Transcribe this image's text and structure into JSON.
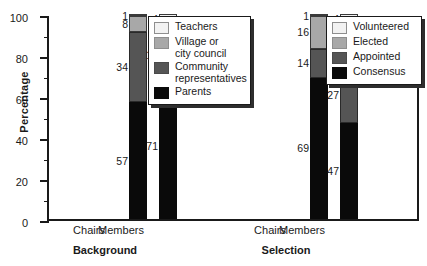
{
  "chart_data": {
    "type": "bar",
    "title": "",
    "subtitle": "",
    "xlabel": "",
    "ylabel": "Percentage",
    "ylim": [
      0,
      100
    ],
    "yticks": [
      0,
      20,
      40,
      60,
      80,
      100
    ],
    "ytick_labels": [
      "0",
      "20",
      "40",
      "60",
      "80",
      "100"
    ],
    "minor_ticks": [
      10,
      30,
      50,
      70,
      90
    ],
    "grid": false,
    "stacked": true,
    "orientation": "vertical",
    "legend_position": "inside-top-right of each panel",
    "panels": [
      {
        "name": "Background",
        "label": "Background",
        "categories": [
          "Chairs",
          "Members"
        ],
        "series": [
          {
            "name": "Parents",
            "color": "#0a0a0a",
            "values": [
              57,
              71
            ]
          },
          {
            "name": "Community representatives",
            "color": "#555555",
            "values": [
              34,
              18
            ]
          },
          {
            "name": "Village or city council",
            "color": "#a8a8a8",
            "values": [
              8,
              7
            ]
          },
          {
            "name": "Teachers",
            "color": "#f2f2f2",
            "values": [
              1,
              4
            ]
          }
        ],
        "legend": [
          {
            "label": "Teachers",
            "color": "#f2f2f2",
            "swatch": "c-white"
          },
          {
            "label": "Village or\ncity council",
            "color": "#a8a8a8",
            "swatch": "c-light"
          },
          {
            "label": "Community\nrepresentatives",
            "color": "#555555",
            "swatch": "c-dark"
          },
          {
            "label": "Parents",
            "color": "#0a0a0a",
            "swatch": "c-black"
          }
        ]
      },
      {
        "name": "Selection",
        "label": "Selection",
        "categories": [
          "Chairs",
          "Members"
        ],
        "series": [
          {
            "name": "Consensus",
            "color": "#0a0a0a",
            "values": [
              69,
              47
            ]
          },
          {
            "name": "Appointed",
            "color": "#555555",
            "values": [
              14,
              27
            ]
          },
          {
            "name": "Elected",
            "color": "#a8a8a8",
            "values": [
              16,
              22
            ]
          },
          {
            "name": "Volunteered",
            "color": "#f2f2f2",
            "values": [
              1,
              4
            ]
          }
        ],
        "legend": [
          {
            "label": "Volunteered",
            "color": "#f2f2f2",
            "swatch": "c-white"
          },
          {
            "label": "Elected",
            "color": "#a8a8a8",
            "swatch": "c-light"
          },
          {
            "label": "Appointed",
            "color": "#555555",
            "swatch": "c-dark"
          },
          {
            "label": "Consensus",
            "color": "#0a0a0a",
            "swatch": "c-black"
          }
        ]
      }
    ],
    "bars": [
      {
        "id": "background-chairs",
        "panel": "Background",
        "category": "Chairs",
        "x": 80,
        "segments": [
          {
            "series": "Parents",
            "value": 57,
            "swatch": "c-black",
            "label": "57"
          },
          {
            "series": "Community representatives",
            "value": 34,
            "swatch": "c-dark",
            "label": "34"
          },
          {
            "series": "Village or city council",
            "value": 8,
            "swatch": "c-light",
            "label": "8"
          },
          {
            "series": "Teachers",
            "value": 1,
            "swatch": "c-white",
            "label": "1"
          }
        ]
      },
      {
        "id": "background-members",
        "panel": "Background",
        "category": "Members",
        "x": 110,
        "segments": [
          {
            "series": "Parents",
            "value": 71,
            "swatch": "c-black",
            "label": "71"
          },
          {
            "series": "Community representatives",
            "value": 18,
            "swatch": "c-dark",
            "label": "18"
          },
          {
            "series": "Village or city council",
            "value": 7,
            "swatch": "c-light",
            "label": "7"
          },
          {
            "series": "Teachers",
            "value": 4,
            "swatch": "c-white",
            "label": "4"
          }
        ]
      },
      {
        "id": "selection-chairs",
        "panel": "Selection",
        "category": "Chairs",
        "x": 261,
        "segments": [
          {
            "series": "Consensus",
            "value": 69,
            "swatch": "c-black",
            "label": "69"
          },
          {
            "series": "Appointed",
            "value": 14,
            "swatch": "c-dark",
            "label": "14"
          },
          {
            "series": "Elected",
            "value": 16,
            "swatch": "c-light",
            "label": "16"
          },
          {
            "series": "Volunteered",
            "value": 1,
            "swatch": "c-white",
            "label": "1"
          }
        ]
      },
      {
        "id": "selection-members",
        "panel": "Selection",
        "category": "Members",
        "x": 291,
        "segments": [
          {
            "series": "Consensus",
            "value": 47,
            "swatch": "c-black",
            "label": "47"
          },
          {
            "series": "Appointed",
            "value": 27,
            "swatch": "c-dark",
            "label": "27"
          },
          {
            "series": "Elected",
            "value": 22,
            "swatch": "c-light",
            "label": "22"
          },
          {
            "series": "Volunteered",
            "value": 4,
            "swatch": "c-white",
            "label": "4"
          }
        ]
      }
    ],
    "category_labels": [
      {
        "text": "Chairs",
        "x": 89
      },
      {
        "text": "Members",
        "x": 121
      },
      {
        "text": "Chairs",
        "x": 270
      },
      {
        "text": "Members",
        "x": 302
      }
    ],
    "group_labels": [
      {
        "text": "Background",
        "x": 105
      },
      {
        "text": "Selection",
        "x": 286
      }
    ]
  }
}
